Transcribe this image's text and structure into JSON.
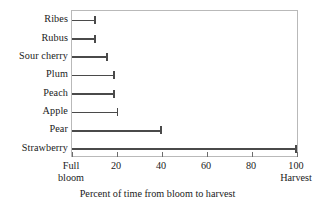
{
  "chart_data": {
    "type": "bar",
    "orientation": "horizontal",
    "title": "",
    "xlabel": "Percent of time from bloom to harvest",
    "ylabel": "",
    "xlim": [
      0,
      100
    ],
    "grid": false,
    "legend": null,
    "categories": [
      "Ribes",
      "Rubus",
      "Sour cherry",
      "Plum",
      "Peach",
      "Apple",
      "Pear",
      "Strawberry"
    ],
    "values": [
      10.5,
      10.5,
      16,
      19,
      19,
      20.5,
      40,
      100
    ],
    "xticks": [
      0,
      20,
      40,
      60,
      80,
      100
    ],
    "xtick_labels": [
      "Full bloom",
      "20",
      "40",
      "60",
      "80",
      "100"
    ],
    "xtick_label_lines": [
      [
        "Full",
        "bloom"
      ],
      [
        "20",
        ""
      ],
      [
        "40",
        ""
      ],
      [
        "60",
        ""
      ],
      [
        "80",
        ""
      ],
      [
        "100",
        "Harvest"
      ]
    ],
    "bar_color": "#4a4a4a",
    "frame_color": "#b9b9b9",
    "background": "#ffffff"
  },
  "axis": {
    "caption": "Percent of time from bloom to harvest"
  }
}
